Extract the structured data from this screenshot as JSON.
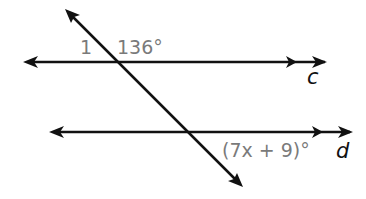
{
  "diagram": {
    "type": "parallel-lines-transversal",
    "lines": [
      {
        "name": "c",
        "label": "c",
        "parallel_mark": true
      },
      {
        "name": "d",
        "label": "d",
        "parallel_mark": true
      }
    ],
    "transversal": {
      "arrows": "both-ends"
    },
    "angles": {
      "angle_1_label": "1",
      "angle_136_label": "136°",
      "angle_expr_label": "(7x + 9)°"
    },
    "colors": {
      "line": "#111111",
      "angle_label": "#7a7a7a"
    }
  }
}
